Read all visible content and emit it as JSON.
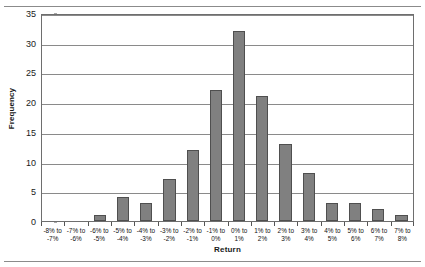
{
  "figure": {
    "name": "return-frequency-histogram",
    "background": "#ffffff",
    "bar_color": "#808080",
    "bar_border_color": "#4f4f4f",
    "grid_color": "#8a8a8a",
    "axis_color": "#6e6e6e"
  },
  "axes": {
    "ylabel": "Frequency",
    "xlabel": "Return",
    "yticks": [
      "0",
      "5",
      "10",
      "15",
      "20",
      "25",
      "30",
      "35"
    ]
  },
  "chart_data": {
    "type": "bar",
    "title": "",
    "subtitle": "",
    "xlabel": "Return",
    "ylabel": "Frequency",
    "ylim": [
      0,
      35
    ],
    "ytick_step": 5,
    "grid": true,
    "legend": false,
    "categories": [
      "-8% to -7%",
      "-7% to -6%",
      "-6% to -5%",
      "-5% to -4%",
      "-4% to -3%",
      "-3% to -2%",
      "-2% to -1%",
      "-1% to 0%",
      "0% to 1%",
      "1% to 2%",
      "2% to 3%",
      "3% to 4%",
      "4% to 5%",
      "5% to 6%",
      "6% to 7%",
      "7% to 8%"
    ],
    "category_lines": [
      [
        "-8% to",
        "-7%"
      ],
      [
        "-7% to",
        "-6%"
      ],
      [
        "-6% to",
        "-5%"
      ],
      [
        "-5% to",
        "-4%"
      ],
      [
        "-4% to",
        "-3%"
      ],
      [
        "-3% to",
        "-2%"
      ],
      [
        "-2% to",
        "-1%"
      ],
      [
        "-1% to",
        "0%"
      ],
      [
        "0% to",
        "1%"
      ],
      [
        "1% to",
        "2%"
      ],
      [
        "2% to",
        "3%"
      ],
      [
        "3% to",
        "4%"
      ],
      [
        "4% to",
        "5%"
      ],
      [
        "5% to",
        "6%"
      ],
      [
        "6% to",
        "7%"
      ],
      [
        "7% to",
        "8%"
      ]
    ],
    "values": [
      0,
      0,
      1,
      4,
      3,
      7,
      12,
      22,
      32,
      21,
      13,
      8,
      3,
      3,
      2,
      1
    ]
  }
}
